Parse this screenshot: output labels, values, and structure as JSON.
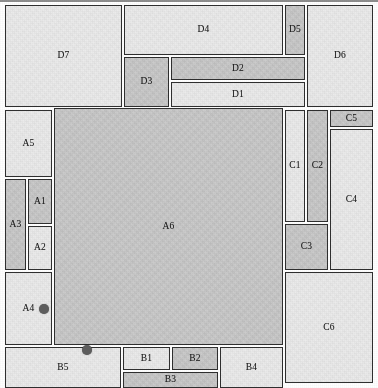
{
  "figure": {
    "width": 378,
    "height": 388,
    "colors": {
      "fill_light": "#ebebeb",
      "fill_dark": "#c9c9c9",
      "stroke": "#2f2f2f",
      "marker": "#5d5d5d",
      "background": "#ffffff"
    }
  },
  "rectangles": [
    {
      "label": "D7",
      "x": 5,
      "y": 5,
      "w": 117,
      "h": 102,
      "shade": "light"
    },
    {
      "label": "D4",
      "x": 124,
      "y": 5,
      "w": 159,
      "h": 50,
      "shade": "light"
    },
    {
      "label": "D5",
      "x": 285,
      "y": 5,
      "w": 20,
      "h": 50,
      "shade": "dark"
    },
    {
      "label": "D6",
      "x": 307,
      "y": 5,
      "w": 66,
      "h": 102,
      "shade": "light"
    },
    {
      "label": "D3",
      "x": 124,
      "y": 57,
      "w": 45,
      "h": 50,
      "shade": "dark"
    },
    {
      "label": "D2",
      "x": 171,
      "y": 57,
      "w": 134,
      "h": 23,
      "shade": "dark"
    },
    {
      "label": "D1",
      "x": 171,
      "y": 82,
      "w": 134,
      "h": 25,
      "shade": "light"
    },
    {
      "label": "A5",
      "x": 5,
      "y": 110,
      "w": 47,
      "h": 67,
      "shade": "light"
    },
    {
      "label": "A3",
      "x": 5,
      "y": 179,
      "w": 21,
      "h": 91,
      "shade": "dark"
    },
    {
      "label": "A1",
      "x": 28,
      "y": 179,
      "w": 24,
      "h": 45,
      "shade": "dark"
    },
    {
      "label": "A2",
      "x": 28,
      "y": 226,
      "w": 24,
      "h": 44,
      "shade": "light"
    },
    {
      "label": "A4",
      "x": 5,
      "y": 272,
      "w": 47,
      "h": 73,
      "shade": "light"
    },
    {
      "label": "A6",
      "x": 54,
      "y": 108,
      "w": 229,
      "h": 237,
      "shade": "dark"
    },
    {
      "label": "C1",
      "x": 285,
      "y": 110,
      "w": 20,
      "h": 112,
      "shade": "light"
    },
    {
      "label": "C2",
      "x": 307,
      "y": 110,
      "w": 21,
      "h": 112,
      "shade": "dark"
    },
    {
      "label": "C5",
      "x": 330,
      "y": 110,
      "w": 43,
      "h": 17,
      "shade": "dark"
    },
    {
      "label": "C4",
      "x": 330,
      "y": 129,
      "w": 43,
      "h": 141,
      "shade": "light"
    },
    {
      "label": "C3",
      "x": 285,
      "y": 224,
      "w": 43,
      "h": 46,
      "shade": "dark"
    },
    {
      "label": "C6",
      "x": 285,
      "y": 272,
      "w": 88,
      "h": 111,
      "shade": "light"
    },
    {
      "label": "B5",
      "x": 5,
      "y": 347,
      "w": 116,
      "h": 41,
      "shade": "light"
    },
    {
      "label": "B1",
      "x": 123,
      "y": 347,
      "w": 47,
      "h": 23,
      "shade": "light"
    },
    {
      "label": "B2",
      "x": 172,
      "y": 347,
      "w": 46,
      "h": 23,
      "shade": "dark"
    },
    {
      "label": "B3",
      "x": 123,
      "y": 372,
      "w": 95,
      "h": 16,
      "shade": "dark"
    },
    {
      "label": "B4",
      "x": 220,
      "y": 347,
      "w": 63,
      "h": 41,
      "shade": "light"
    }
  ],
  "markers": [
    {
      "name": "marker-a4",
      "x": 44,
      "y": 309,
      "r": 5
    },
    {
      "name": "marker-b5",
      "x": 87,
      "y": 350,
      "r": 5
    }
  ]
}
